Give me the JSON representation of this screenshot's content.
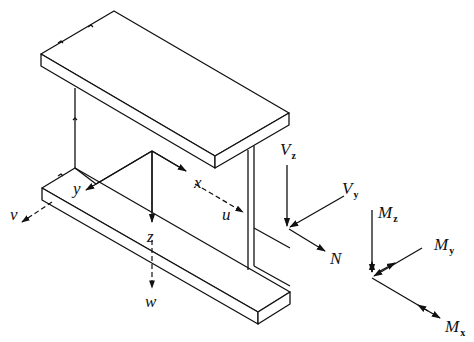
{
  "figure": {
    "beam_axes": {
      "x": "x",
      "y": "y",
      "z": "z"
    },
    "displacements": {
      "u": "u",
      "v": "v",
      "w": "w"
    },
    "forces": {
      "vz": {
        "base": "V",
        "sub": "z"
      },
      "vy": {
        "base": "V",
        "sub": "y"
      },
      "n": "N"
    },
    "moments": {
      "mz": {
        "base": "M",
        "sub": "z"
      },
      "my": {
        "base": "M",
        "sub": "y"
      },
      "mx": {
        "base": "M",
        "sub": "x"
      }
    },
    "colors": {
      "line": "#111111",
      "background": "#ffffff"
    }
  }
}
